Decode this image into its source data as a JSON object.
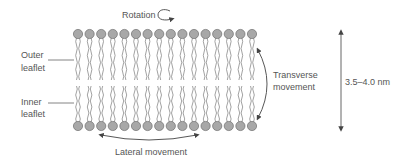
{
  "diagram": {
    "labels": {
      "rotation": "Rotation",
      "outer_leaflet": [
        "Outer",
        "leaflet"
      ],
      "inner_leaflet": [
        "Inner",
        "leaflet"
      ],
      "transverse": [
        "Transverse",
        "movement"
      ],
      "lateral": "Lateral movement",
      "thickness": "3.5–4.0 nm"
    },
    "bilayer": {
      "lipid_count_per_leaflet": 16,
      "head_color": "#a8a8a8",
      "head_stroke": "#6e6e6e",
      "tail_color": "#7a7a7a"
    },
    "colors": {
      "text": "#555555",
      "arrow": "#444444",
      "line": "#666666"
    }
  }
}
